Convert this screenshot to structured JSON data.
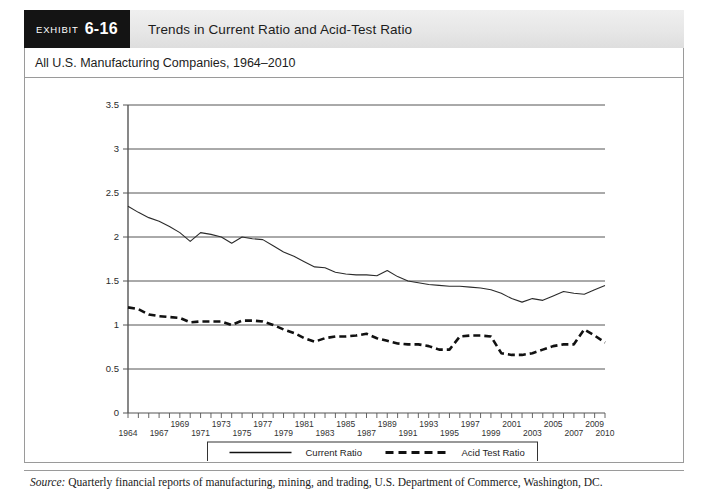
{
  "header": {
    "exhibit_word": "EXHIBIT",
    "exhibit_number": "6-16",
    "title": "Trends in Current Ratio and Acid-Test Ratio"
  },
  "subtitle": "All U.S. Manufacturing Companies, 1964–2010",
  "source": {
    "label": "Source:",
    "text": "Quarterly financial reports of manufacturing, mining, and trading, U.S. Department of Commerce, Washington, DC."
  },
  "chart_data": {
    "type": "line",
    "title": "Trends in Current Ratio and Acid-Test Ratio",
    "subtitle": "All U.S. Manufacturing Companies, 1964–2010",
    "xlabel": "",
    "ylabel": "",
    "xlim": [
      1964,
      2010
    ],
    "ylim": [
      0,
      3.5
    ],
    "ytick_values": [
      0,
      0.5,
      1,
      1.5,
      2,
      2.5,
      3,
      3.5
    ],
    "ytick_labels": [
      "0",
      "0.5",
      "1",
      "1.5",
      "2",
      "2.5",
      "3",
      "3.5"
    ],
    "grid": true,
    "grid_axis": "y",
    "legend_position": "bottom",
    "xtick_labels_upper": [
      "1969",
      "1973",
      "1977",
      "1981",
      "1985",
      "1989",
      "1993",
      "1997",
      "2001",
      "2005",
      "2009"
    ],
    "xtick_labels_lower": [
      "1964",
      "1967",
      "1971",
      "1975",
      "1979",
      "1983",
      "1987",
      "1991",
      "1995",
      "1999",
      "2003",
      "2007",
      "2010"
    ],
    "x": [
      1964,
      1965,
      1966,
      1967,
      1968,
      1969,
      1970,
      1971,
      1972,
      1973,
      1974,
      1975,
      1976,
      1977,
      1978,
      1979,
      1980,
      1981,
      1982,
      1983,
      1984,
      1985,
      1986,
      1987,
      1988,
      1989,
      1990,
      1991,
      1992,
      1993,
      1994,
      1995,
      1996,
      1997,
      1998,
      1999,
      2000,
      2001,
      2002,
      2003,
      2004,
      2005,
      2006,
      2007,
      2008,
      2009,
      2010
    ],
    "series": [
      {
        "name": "Current Ratio",
        "style": "solid",
        "color": "#2b2b2b",
        "values": [
          2.35,
          2.28,
          2.22,
          2.18,
          2.12,
          2.05,
          1.95,
          2.05,
          2.03,
          2.0,
          1.93,
          2.0,
          1.98,
          1.97,
          1.9,
          1.83,
          1.78,
          1.72,
          1.66,
          1.65,
          1.6,
          1.58,
          1.57,
          1.57,
          1.56,
          1.62,
          1.55,
          1.5,
          1.48,
          1.46,
          1.45,
          1.44,
          1.44,
          1.43,
          1.42,
          1.4,
          1.36,
          1.3,
          1.26,
          1.3,
          1.28,
          1.33,
          1.38,
          1.36,
          1.35,
          1.4,
          1.45
        ]
      },
      {
        "name": "Acid Test Ratio",
        "style": "dashed",
        "color": "#111111",
        "values": [
          1.2,
          1.18,
          1.12,
          1.1,
          1.09,
          1.08,
          1.03,
          1.04,
          1.04,
          1.04,
          1.0,
          1.05,
          1.05,
          1.04,
          1.0,
          0.95,
          0.91,
          0.85,
          0.81,
          0.85,
          0.87,
          0.87,
          0.88,
          0.9,
          0.85,
          0.82,
          0.79,
          0.78,
          0.78,
          0.76,
          0.72,
          0.72,
          0.87,
          0.88,
          0.88,
          0.87,
          0.68,
          0.66,
          0.66,
          0.68,
          0.72,
          0.76,
          0.78,
          0.78,
          0.95,
          0.88,
          0.8
        ]
      }
    ]
  },
  "legend": {
    "items": [
      {
        "label": "Current Ratio",
        "style": "solid"
      },
      {
        "label": "Acid Test Ratio",
        "style": "dashed"
      }
    ]
  }
}
